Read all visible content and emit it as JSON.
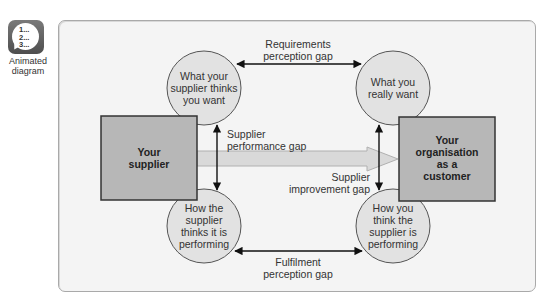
{
  "badge": {
    "icon": "numbered-list-speech-bubble-icon",
    "lines": [
      "1...",
      "2...",
      "3..."
    ],
    "label_line1": "Animated",
    "label_line2": "diagram"
  },
  "diagram": {
    "colors": {
      "frame_bg": "#f4f4f4",
      "circle_fill": "#e2e2e2",
      "box_fill": "#b7b7b7",
      "box_border": "#333333",
      "big_arrow_fill": "#d9d9d9",
      "line": "#111111"
    },
    "boxes": {
      "supplier": {
        "line1": "Your",
        "line2": "supplier"
      },
      "customer": {
        "line1": "Your",
        "line2": "organisation",
        "line3": "as a",
        "line4": "customer"
      }
    },
    "circles": {
      "top_left": {
        "line1": "What your",
        "line2": "supplier thinks",
        "line3": "you want"
      },
      "top_right": {
        "line1": "What you",
        "line2": "really want"
      },
      "bottom_left": {
        "line1": "How the",
        "line2": "supplier",
        "line3": "thinks it is",
        "line4": "performing"
      },
      "bottom_right": {
        "line1": "How you",
        "line2": "think the",
        "line3": "supplier is",
        "line4": "performing"
      }
    },
    "gaps": {
      "requirements": {
        "line1": "Requirements",
        "line2": "perception gap"
      },
      "supplier_performance": {
        "line1": "Supplier",
        "line2": "performance gap"
      },
      "supplier_improvement": {
        "line1": "Supplier",
        "line2": "improvement gap"
      },
      "fulfilment": {
        "line1": "Fulfilment",
        "line2": "perception gap"
      }
    }
  }
}
